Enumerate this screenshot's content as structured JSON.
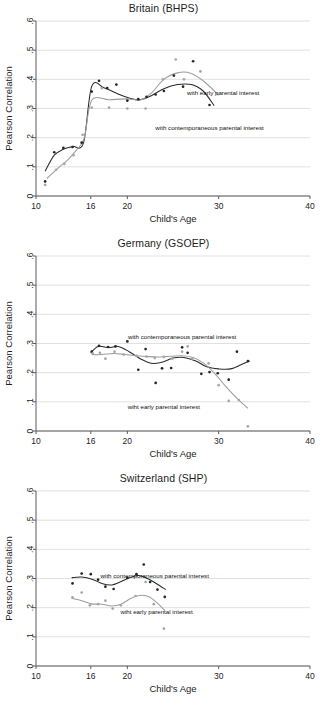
{
  "figure": {
    "y_axis_title": "Pearson Correlation",
    "x_axis_title": "Child's Age",
    "y_ticks": [
      "0",
      ".1",
      ".2",
      ".3",
      ".4",
      ".5",
      ".6"
    ],
    "x_ticks": [
      "10",
      "16",
      "20",
      "30",
      "40"
    ],
    "annotation_contemporaneous": "with contemporaneous parental interest",
    "annotation_early": "with early parental interest",
    "annotation_early_typo": "wiht early parental interest",
    "colors": {
      "dark_series": "#2b2b2b",
      "light_series": "#9d9d9d",
      "grid": "#d8d8d8",
      "axis": "#5a5a5a"
    }
  },
  "chart_data": [
    {
      "type": "scatter",
      "title": "Britain (BHPS)",
      "xlabel": "Child's Age",
      "ylabel": "Pearson Correlation",
      "xlim": [
        10,
        40
      ],
      "ylim": [
        0,
        0.6
      ],
      "x_ticks": [
        10,
        16,
        20,
        30,
        40
      ],
      "y_ticks": [
        0,
        0.1,
        0.2,
        0.3,
        0.4,
        0.5,
        0.6
      ],
      "grid": true,
      "legend": "annotations-inline",
      "annotations": [
        {
          "text": "with early parental interest",
          "x": 30.5,
          "y": 0.345
        },
        {
          "text": "with contemporaneous parental interest",
          "x": 29.0,
          "y": 0.225
        }
      ],
      "series": [
        {
          "name": "with contemporaneous parental interest",
          "style": "dark",
          "points": [
            {
              "x": 11.0,
              "y": 0.05
            },
            {
              "x": 12.0,
              "y": 0.15
            },
            {
              "x": 13.0,
              "y": 0.165
            },
            {
              "x": 14.0,
              "y": 0.168
            },
            {
              "x": 15.0,
              "y": 0.183
            },
            {
              "x": 16.9,
              "y": 0.395
            },
            {
              "x": 17.8,
              "y": 0.37
            },
            {
              "x": 18.8,
              "y": 0.382
            },
            {
              "x": 16.1,
              "y": 0.358
            },
            {
              "x": 20.0,
              "y": 0.327
            },
            {
              "x": 21.2,
              "y": 0.332
            },
            {
              "x": 22.1,
              "y": 0.34
            },
            {
              "x": 23.1,
              "y": 0.348
            },
            {
              "x": 24.0,
              "y": 0.36
            },
            {
              "x": 25.1,
              "y": 0.413
            },
            {
              "x": 26.1,
              "y": 0.375
            },
            {
              "x": 27.2,
              "y": 0.462
            },
            {
              "x": 29.0,
              "y": 0.312
            }
          ],
          "smooth": [
            {
              "x": 11.0,
              "y": 0.085
            },
            {
              "x": 12.0,
              "y": 0.14
            },
            {
              "x": 13.0,
              "y": 0.16
            },
            {
              "x": 14.0,
              "y": 0.17
            },
            {
              "x": 15.2,
              "y": 0.182
            },
            {
              "x": 16.1,
              "y": 0.376
            },
            {
              "x": 17.5,
              "y": 0.37
            },
            {
              "x": 19.0,
              "y": 0.35
            },
            {
              "x": 20.5,
              "y": 0.333
            },
            {
              "x": 21.4,
              "y": 0.33
            },
            {
              "x": 22.5,
              "y": 0.342
            },
            {
              "x": 24.0,
              "y": 0.368
            },
            {
              "x": 25.5,
              "y": 0.382
            },
            {
              "x": 27.0,
              "y": 0.382
            },
            {
              "x": 28.3,
              "y": 0.36
            },
            {
              "x": 29.5,
              "y": 0.31
            }
          ]
        },
        {
          "name": "with early parental interest",
          "style": "light",
          "points": [
            {
              "x": 11.0,
              "y": 0.038
            },
            {
              "x": 12.2,
              "y": 0.09
            },
            {
              "x": 13.1,
              "y": 0.11
            },
            {
              "x": 14.1,
              "y": 0.14
            },
            {
              "x": 15.1,
              "y": 0.21
            },
            {
              "x": 16.1,
              "y": 0.303
            },
            {
              "x": 17.2,
              "y": 0.37
            },
            {
              "x": 18.0,
              "y": 0.303
            },
            {
              "x": 20.0,
              "y": 0.3
            },
            {
              "x": 22.0,
              "y": 0.3
            },
            {
              "x": 23.9,
              "y": 0.4
            },
            {
              "x": 25.3,
              "y": 0.468
            },
            {
              "x": 26.2,
              "y": 0.4
            },
            {
              "x": 28.0,
              "y": 0.427
            }
          ],
          "smooth": [
            {
              "x": 11.2,
              "y": 0.06
            },
            {
              "x": 12.5,
              "y": 0.098
            },
            {
              "x": 13.5,
              "y": 0.125
            },
            {
              "x": 14.5,
              "y": 0.16
            },
            {
              "x": 15.3,
              "y": 0.2
            },
            {
              "x": 16.1,
              "y": 0.328
            },
            {
              "x": 18.0,
              "y": 0.33
            },
            {
              "x": 20.0,
              "y": 0.333
            },
            {
              "x": 21.5,
              "y": 0.33
            },
            {
              "x": 22.7,
              "y": 0.355
            },
            {
              "x": 24.0,
              "y": 0.4
            },
            {
              "x": 25.6,
              "y": 0.423
            },
            {
              "x": 27.0,
              "y": 0.42
            },
            {
              "x": 28.5,
              "y": 0.39
            },
            {
              "x": 30.0,
              "y": 0.345
            }
          ]
        }
      ]
    },
    {
      "type": "scatter",
      "title": "Germany (GSOEP)",
      "xlabel": "Child's Age",
      "ylabel": "Pearson Correlation",
      "xlim": [
        10,
        40
      ],
      "ylim": [
        0,
        0.6
      ],
      "x_ticks": [
        10,
        16,
        20,
        30,
        40
      ],
      "y_ticks": [
        0,
        0.1,
        0.2,
        0.3,
        0.4,
        0.5,
        0.6
      ],
      "grid": true,
      "legend": "annotations-inline",
      "annotations": [
        {
          "text": "with contemporaneous parental interest",
          "x": 26.0,
          "y": 0.315
        },
        {
          "text": "wiht early parental interest",
          "x": 24.0,
          "y": 0.075
        }
      ],
      "series": [
        {
          "name": "with contemporaneous parental interest",
          "style": "dark",
          "points": [
            {
              "x": 16.1,
              "y": 0.272
            },
            {
              "x": 16.9,
              "y": 0.292
            },
            {
              "x": 17.9,
              "y": 0.288
            },
            {
              "x": 18.7,
              "y": 0.29
            },
            {
              "x": 20.0,
              "y": 0.307
            },
            {
              "x": 21.2,
              "y": 0.21
            },
            {
              "x": 22.0,
              "y": 0.281
            },
            {
              "x": 23.1,
              "y": 0.165
            },
            {
              "x": 23.8,
              "y": 0.215
            },
            {
              "x": 24.8,
              "y": 0.216
            },
            {
              "x": 26.0,
              "y": 0.287
            },
            {
              "x": 26.6,
              "y": 0.268
            },
            {
              "x": 28.1,
              "y": 0.196
            },
            {
              "x": 29.0,
              "y": 0.202
            },
            {
              "x": 29.9,
              "y": 0.198
            },
            {
              "x": 31.1,
              "y": 0.176
            },
            {
              "x": 32.0,
              "y": 0.272
            },
            {
              "x": 33.2,
              "y": 0.24
            }
          ],
          "smooth": [
            {
              "x": 16.0,
              "y": 0.268
            },
            {
              "x": 16.8,
              "y": 0.29
            },
            {
              "x": 18.0,
              "y": 0.286
            },
            {
              "x": 19.0,
              "y": 0.29
            },
            {
              "x": 20.2,
              "y": 0.272
            },
            {
              "x": 21.4,
              "y": 0.248
            },
            {
              "x": 22.6,
              "y": 0.232
            },
            {
              "x": 23.8,
              "y": 0.236
            },
            {
              "x": 25.0,
              "y": 0.25
            },
            {
              "x": 26.2,
              "y": 0.252
            },
            {
              "x": 27.5,
              "y": 0.24
            },
            {
              "x": 28.7,
              "y": 0.22
            },
            {
              "x": 30.0,
              "y": 0.213
            },
            {
              "x": 31.3,
              "y": 0.213
            },
            {
              "x": 32.5,
              "y": 0.228
            },
            {
              "x": 33.4,
              "y": 0.24
            }
          ]
        },
        {
          "name": "wiht early parental interest",
          "style": "light",
          "points": [
            {
              "x": 16.2,
              "y": 0.266
            },
            {
              "x": 17.0,
              "y": 0.268
            },
            {
              "x": 17.6,
              "y": 0.248
            },
            {
              "x": 18.6,
              "y": 0.272
            },
            {
              "x": 19.6,
              "y": 0.262
            },
            {
              "x": 21.0,
              "y": 0.258
            },
            {
              "x": 22.1,
              "y": 0.255
            },
            {
              "x": 23.0,
              "y": 0.25
            },
            {
              "x": 24.0,
              "y": 0.254
            },
            {
              "x": 24.9,
              "y": 0.248
            },
            {
              "x": 26.0,
              "y": 0.272
            },
            {
              "x": 26.6,
              "y": 0.29
            },
            {
              "x": 27.1,
              "y": 0.248
            },
            {
              "x": 28.9,
              "y": 0.232
            },
            {
              "x": 30.0,
              "y": 0.157
            },
            {
              "x": 31.1,
              "y": 0.103
            },
            {
              "x": 32.2,
              "y": 0.106
            },
            {
              "x": 33.2,
              "y": 0.016
            }
          ],
          "smooth": [
            {
              "x": 16.1,
              "y": 0.262
            },
            {
              "x": 17.2,
              "y": 0.262
            },
            {
              "x": 18.5,
              "y": 0.266
            },
            {
              "x": 19.8,
              "y": 0.262
            },
            {
              "x": 21.0,
              "y": 0.258
            },
            {
              "x": 22.3,
              "y": 0.255
            },
            {
              "x": 23.6,
              "y": 0.254
            },
            {
              "x": 24.8,
              "y": 0.256
            },
            {
              "x": 26.0,
              "y": 0.258
            },
            {
              "x": 27.2,
              "y": 0.252
            },
            {
              "x": 28.4,
              "y": 0.232
            },
            {
              "x": 29.6,
              "y": 0.196
            },
            {
              "x": 30.8,
              "y": 0.152
            },
            {
              "x": 32.0,
              "y": 0.112
            },
            {
              "x": 33.2,
              "y": 0.078
            }
          ]
        }
      ]
    },
    {
      "type": "scatter",
      "title": "Switzerland (SHP)",
      "xlabel": "Child's Age",
      "ylabel": "Pearson Correlation",
      "xlim": [
        10,
        40
      ],
      "ylim": [
        0,
        0.6
      ],
      "x_ticks": [
        10,
        16,
        20,
        30,
        40
      ],
      "y_ticks": [
        0,
        0.1,
        0.2,
        0.3,
        0.4,
        0.5,
        0.6
      ],
      "grid": true,
      "legend": "annotations-inline",
      "annotations": [
        {
          "text": "with contemporaneous parental interest",
          "x": 23.0,
          "y": 0.303
        },
        {
          "text": "wiht early parental interest",
          "x": 23.2,
          "y": 0.178
        }
      ],
      "series": [
        {
          "name": "with contemporaneous parental interest",
          "style": "dark",
          "points": [
            {
              "x": 14.0,
              "y": 0.283
            },
            {
              "x": 15.0,
              "y": 0.317
            },
            {
              "x": 16.0,
              "y": 0.315
            },
            {
              "x": 16.8,
              "y": 0.296
            },
            {
              "x": 17.6,
              "y": 0.272
            },
            {
              "x": 18.5,
              "y": 0.264
            },
            {
              "x": 20.0,
              "y": 0.302
            },
            {
              "x": 21.0,
              "y": 0.315
            },
            {
              "x": 21.8,
              "y": 0.348
            },
            {
              "x": 22.5,
              "y": 0.288
            },
            {
              "x": 23.3,
              "y": 0.262
            },
            {
              "x": 24.1,
              "y": 0.237
            }
          ],
          "smooth": [
            {
              "x": 13.9,
              "y": 0.303
            },
            {
              "x": 15.0,
              "y": 0.305
            },
            {
              "x": 16.2,
              "y": 0.297
            },
            {
              "x": 17.3,
              "y": 0.282
            },
            {
              "x": 18.3,
              "y": 0.278
            },
            {
              "x": 19.2,
              "y": 0.288
            },
            {
              "x": 20.2,
              "y": 0.302
            },
            {
              "x": 21.2,
              "y": 0.31
            },
            {
              "x": 22.2,
              "y": 0.3
            },
            {
              "x": 23.2,
              "y": 0.282
            },
            {
              "x": 24.2,
              "y": 0.262
            }
          ]
        },
        {
          "name": "wiht early parental interest",
          "style": "light",
          "points": [
            {
              "x": 14.0,
              "y": 0.235
            },
            {
              "x": 15.0,
              "y": 0.252
            },
            {
              "x": 15.9,
              "y": 0.208
            },
            {
              "x": 16.8,
              "y": 0.212
            },
            {
              "x": 17.6,
              "y": 0.224
            },
            {
              "x": 18.4,
              "y": 0.197
            },
            {
              "x": 19.3,
              "y": 0.208
            },
            {
              "x": 20.9,
              "y": 0.24
            },
            {
              "x": 22.0,
              "y": 0.288
            },
            {
              "x": 22.9,
              "y": 0.212
            },
            {
              "x": 24.0,
              "y": 0.128
            }
          ],
          "smooth": [
            {
              "x": 13.9,
              "y": 0.232
            },
            {
              "x": 15.0,
              "y": 0.224
            },
            {
              "x": 16.1,
              "y": 0.213
            },
            {
              "x": 17.2,
              "y": 0.212
            },
            {
              "x": 18.3,
              "y": 0.206
            },
            {
              "x": 19.3,
              "y": 0.212
            },
            {
              "x": 20.4,
              "y": 0.232
            },
            {
              "x": 21.3,
              "y": 0.242
            },
            {
              "x": 22.3,
              "y": 0.238
            },
            {
              "x": 23.2,
              "y": 0.218
            },
            {
              "x": 24.1,
              "y": 0.19
            }
          ]
        }
      ]
    }
  ]
}
